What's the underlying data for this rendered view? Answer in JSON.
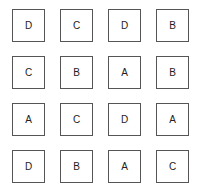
{
  "grid": {
    "rows": [
      [
        "D",
        "C",
        "D",
        "B"
      ],
      [
        "C",
        "B",
        "A",
        "B"
      ],
      [
        "A",
        "C",
        "D",
        "A"
      ],
      [
        "D",
        "B",
        "A",
        "C"
      ]
    ]
  }
}
